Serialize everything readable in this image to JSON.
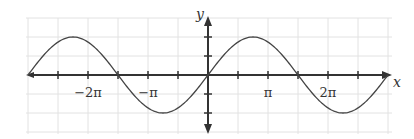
{
  "chart_data": {
    "type": "line",
    "title": "",
    "xlabel": "x",
    "ylabel": "y",
    "function": "y = 2 sin(2x/3)",
    "series": [
      {
        "name": "y = 2 sin(2x/3)",
        "amplitude": 2,
        "period": "3π",
        "phase": 0,
        "key_points": [
          {
            "x": "-3π",
            "y": 0
          },
          {
            "x": "-9π/4",
            "y": 2
          },
          {
            "x": "-3π/2",
            "y": 0
          },
          {
            "x": "-3π/4",
            "y": -2
          },
          {
            "x": "0",
            "y": 0
          },
          {
            "x": "3π/4",
            "y": 2
          },
          {
            "x": "3π/2",
            "y": 0
          },
          {
            "x": "9π/4",
            "y": -2
          },
          {
            "x": "3π",
            "y": 0
          }
        ]
      }
    ],
    "x_tick_labels": [
      "−2π",
      "−π",
      "π",
      "2π"
    ],
    "x_tick_values": [
      -6.2832,
      -3.1416,
      3.1416,
      6.2832
    ],
    "x_tick_step": "π/2",
    "y_tick_step": 1,
    "xlim": [
      "-3π",
      "3π"
    ],
    "ylim": [
      -3,
      3
    ],
    "grid": true,
    "legend": null
  },
  "labels": {
    "x_axis": "x",
    "y_axis": "y",
    "ticks": [
      "−2π",
      "−π",
      "π",
      "2π"
    ]
  },
  "colors": {
    "axis": "#333333",
    "curve": "#444444",
    "grid": "#e2e2e2"
  }
}
